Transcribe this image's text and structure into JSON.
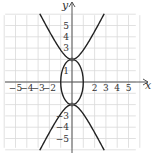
{
  "chart_data": {
    "type": "line",
    "title": "",
    "xlabel": "x",
    "ylabel": "y",
    "xlim": [
      -6,
      6
    ],
    "ylim": [
      -6,
      6
    ],
    "grid": true,
    "x_tick_labels": [
      "-5",
      "-4",
      "-3",
      "-2",
      "2",
      "3",
      "4",
      "5"
    ],
    "y_tick_labels": [
      "5",
      "4",
      "3",
      "1",
      "3",
      "4",
      "5"
    ],
    "y_tick_labels_display": [
      {
        "value": 5,
        "label": "5"
      },
      {
        "value": 4,
        "label": "4"
      },
      {
        "value": 3,
        "label": "3"
      },
      {
        "value": 1,
        "label": "1"
      },
      {
        "value": -3,
        "label": "3"
      },
      {
        "value": -4,
        "label": "4"
      },
      {
        "value": -5,
        "label": "5"
      }
    ],
    "series": [
      {
        "name": "hyperbola",
        "equation": "y^2/4 - x^2 = 1",
        "branches": [
          "upper",
          "lower"
        ],
        "vertices": [
          [
            0,
            2
          ],
          [
            0,
            -2
          ]
        ]
      },
      {
        "name": "ellipse",
        "equation": "x^2 + y^2/4 = 1",
        "center": [
          0,
          0
        ],
        "semi_axes": {
          "x": 1,
          "y": 2
        }
      }
    ],
    "intersection_points": [
      [
        0,
        2
      ],
      [
        0,
        -2
      ]
    ],
    "colors": {
      "curve": "#222222",
      "grid": "#d9d9d9",
      "axis": "#555555",
      "point": "#555555"
    }
  },
  "labels": {
    "x_axis": "x",
    "y_axis": "y",
    "x_ticks": [
      {
        "v": -5,
        "t": "−5"
      },
      {
        "v": -4,
        "t": "−4"
      },
      {
        "v": -3,
        "t": "−3"
      },
      {
        "v": -2,
        "t": "−2"
      },
      {
        "v": 2,
        "t": "2"
      },
      {
        "v": 3,
        "t": "3"
      },
      {
        "v": 4,
        "t": "4"
      },
      {
        "v": 5,
        "t": "5"
      }
    ],
    "y_ticks": [
      {
        "v": 5,
        "t": "5"
      },
      {
        "v": 4,
        "t": "4"
      },
      {
        "v": 3,
        "t": "3"
      },
      {
        "v": 1,
        "t": "1"
      },
      {
        "v": -3,
        "t": "−3"
      },
      {
        "v": -4,
        "t": "−4"
      },
      {
        "v": -5,
        "t": "−5"
      }
    ]
  }
}
